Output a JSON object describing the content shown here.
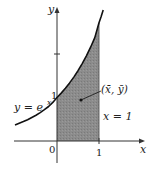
{
  "diagram": {
    "type": "function-graph",
    "curve_label": "y = e",
    "curve_exponent": "x",
    "axis_x_label": "x",
    "axis_y_label": "y",
    "origin_label": "0",
    "tick_x_label": "1",
    "tick_y_label": "1",
    "centroid_label": "(x̄, ȳ)",
    "boundary_label": "x = 1",
    "colors": {
      "region_fill": "#8a8a8a",
      "curve": "#111111",
      "axes": "#333333"
    },
    "region": {
      "description": "area under y = e^x from x = 0 to x = 1",
      "x_from": 0,
      "x_to": 1
    }
  }
}
